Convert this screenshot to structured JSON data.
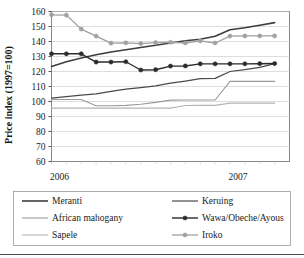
{
  "chart_data": {
    "type": "line",
    "title": "",
    "xlabel": "",
    "ylabel": "Price index (1997=100)",
    "ylim": [
      60,
      160
    ],
    "ytick_labels": [
      "160",
      "150",
      "140",
      "130",
      "120",
      "110",
      "100",
      "90",
      "80",
      "70",
      "60"
    ],
    "ytick_values": [
      160,
      150,
      140,
      130,
      120,
      110,
      100,
      90,
      80,
      70,
      60
    ],
    "xtick_labels": [
      "2006",
      "2007"
    ],
    "xtick_positions": [
      0,
      12
    ],
    "x": [
      0,
      1,
      2,
      3,
      4,
      5,
      6,
      7,
      8,
      9,
      10,
      11,
      12,
      13,
      14,
      15
    ],
    "grid": true,
    "legend_position": "bottom",
    "series": [
      {
        "name": "Meranti",
        "color": "#3d3d3d",
        "width": 1.6,
        "marker": "none",
        "values": [
          123.4,
          126.5,
          129.0,
          131.2,
          133.0,
          134.5,
          136.0,
          137.5,
          139.0,
          140.5,
          141.5,
          143.5,
          147.8,
          149.2,
          150.8,
          152.6
        ]
      },
      {
        "name": "Keruing",
        "color": "#4a4a4a",
        "width": 1.2,
        "marker": "none",
        "values": [
          102.3,
          103.2,
          104.2,
          105.1,
          106.8,
          108.2,
          109.2,
          110.4,
          112.2,
          113.6,
          115.2,
          115.4,
          120.0,
          121.2,
          122.8,
          125.3
        ]
      },
      {
        "name": "African mahogany",
        "color": "#9a9a9a",
        "width": 1.1,
        "marker": "none",
        "values": [
          101.3,
          101.3,
          101.3,
          97.2,
          97.2,
          97.4,
          98.2,
          99.4,
          100.9,
          101.0,
          101.0,
          101.0,
          113.4,
          113.4,
          113.4,
          113.4
        ]
      },
      {
        "name": "Wawa/Obeche/Ayous",
        "color": "#2b2b2b",
        "width": 1.4,
        "marker": "circle",
        "values": [
          131.8,
          131.8,
          131.8,
          126.3,
          126.3,
          126.5,
          121.0,
          121.2,
          123.6,
          123.7,
          125.1,
          125.1,
          125.1,
          125.1,
          125.2,
          125.3
        ]
      },
      {
        "name": "Sapele",
        "color": "#b4b4b4",
        "width": 1.1,
        "marker": "none",
        "values": [
          95.6,
          95.6,
          95.6,
          95.6,
          95.6,
          95.6,
          95.6,
          95.6,
          95.6,
          97.3,
          97.4,
          97.4,
          98.9,
          98.9,
          98.9,
          98.9
        ]
      },
      {
        "name": "Iroko",
        "color": "#a0a0a0",
        "width": 1.3,
        "marker": "circle",
        "values": [
          157.8,
          157.6,
          148.3,
          143.6,
          138.9,
          139.1,
          138.6,
          139.3,
          139.5,
          139.0,
          140.4,
          139.0,
          143.6,
          143.7,
          143.7,
          143.7
        ]
      }
    ]
  },
  "legend": {
    "entries": [
      {
        "label": "Meranti"
      },
      {
        "label": "Keruing"
      },
      {
        "label": "African mahogany"
      },
      {
        "label": "Wawa/Obeche/Ayous"
      },
      {
        "label": "Sapele"
      },
      {
        "label": "Iroko"
      }
    ]
  }
}
